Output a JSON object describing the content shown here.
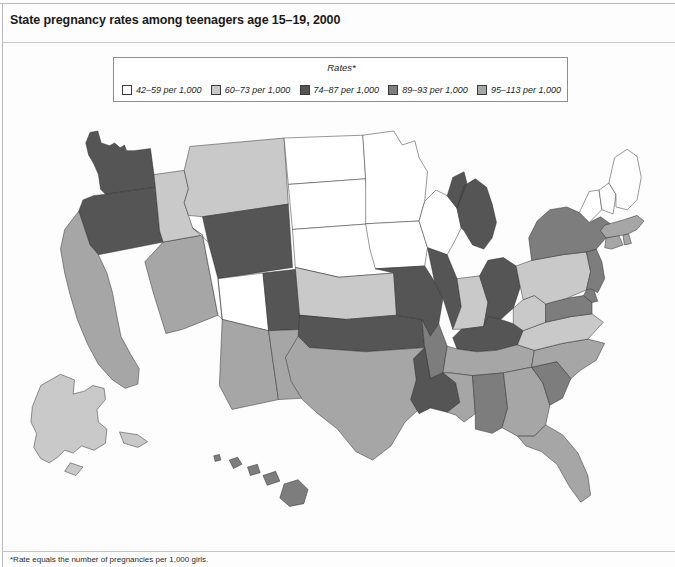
{
  "title": "State pregnancy rates among teenagers age 15–19, 2000",
  "legend": {
    "heading": "Rates*",
    "items": [
      {
        "label": "42–59 per 1,000",
        "color": "#ffffff",
        "key": "b1"
      },
      {
        "label": "60–73 per 1,000",
        "color": "#c9c9c9",
        "key": "b2"
      },
      {
        "label": "74–87 per 1,000",
        "color": "#555555",
        "key": "b3"
      },
      {
        "label": "89–93 per 1,000",
        "color": "#7d7d7d",
        "key": "b4"
      },
      {
        "label": "95–113 per 1,000",
        "color": "#a6a6a6",
        "key": "b5"
      }
    ]
  },
  "footnote": "*Rate equals the number of pregnancies per 1,000 girls.",
  "chart_data": {
    "type": "map",
    "title": "State pregnancy rates among teenagers age 15–19, 2000",
    "unit": "pregnancies per 1,000 girls age 15–19",
    "bins": [
      {
        "key": "b1",
        "range": "42–59",
        "min": 42,
        "max": 59,
        "color": "#ffffff"
      },
      {
        "key": "b2",
        "range": "60–73",
        "min": 60,
        "max": 73,
        "color": "#c9c9c9"
      },
      {
        "key": "b3",
        "range": "74–87",
        "min": 74,
        "max": 87,
        "color": "#555555"
      },
      {
        "key": "b4",
        "range": "89–93",
        "min": 89,
        "max": 93,
        "color": "#7d7d7d"
      },
      {
        "key": "b5",
        "range": "95–113",
        "min": 95,
        "max": 113,
        "color": "#a6a6a6"
      }
    ],
    "legend_position": "top-center",
    "regions": [
      {
        "id": "WA",
        "name": "Washington",
        "bin": "b3"
      },
      {
        "id": "OR",
        "name": "Oregon",
        "bin": "b3"
      },
      {
        "id": "CA",
        "name": "California",
        "bin": "b5"
      },
      {
        "id": "NV",
        "name": "Nevada",
        "bin": "b5"
      },
      {
        "id": "ID",
        "name": "Idaho",
        "bin": "b2"
      },
      {
        "id": "MT",
        "name": "Montana",
        "bin": "b2"
      },
      {
        "id": "WY",
        "name": "Wyoming",
        "bin": "b3"
      },
      {
        "id": "UT",
        "name": "Utah",
        "bin": "b1"
      },
      {
        "id": "AZ",
        "name": "Arizona",
        "bin": "b5"
      },
      {
        "id": "CO",
        "name": "Colorado",
        "bin": "b3"
      },
      {
        "id": "NM",
        "name": "New Mexico",
        "bin": "b5"
      },
      {
        "id": "ND",
        "name": "North Dakota",
        "bin": "b1"
      },
      {
        "id": "SD",
        "name": "South Dakota",
        "bin": "b1"
      },
      {
        "id": "NE",
        "name": "Nebraska",
        "bin": "b1"
      },
      {
        "id": "KS",
        "name": "Kansas",
        "bin": "b2"
      },
      {
        "id": "OK",
        "name": "Oklahoma",
        "bin": "b3"
      },
      {
        "id": "TX",
        "name": "Texas",
        "bin": "b5"
      },
      {
        "id": "MN",
        "name": "Minnesota",
        "bin": "b1"
      },
      {
        "id": "IA",
        "name": "Iowa",
        "bin": "b1"
      },
      {
        "id": "MO",
        "name": "Missouri",
        "bin": "b3"
      },
      {
        "id": "AR",
        "name": "Arkansas",
        "bin": "b4"
      },
      {
        "id": "LA",
        "name": "Louisiana",
        "bin": "b3"
      },
      {
        "id": "WI",
        "name": "Wisconsin",
        "bin": "b1"
      },
      {
        "id": "IL",
        "name": "Illinois",
        "bin": "b3"
      },
      {
        "id": "MI",
        "name": "Michigan",
        "bin": "b3"
      },
      {
        "id": "IN",
        "name": "Indiana",
        "bin": "b2"
      },
      {
        "id": "OH",
        "name": "Ohio",
        "bin": "b3"
      },
      {
        "id": "KY",
        "name": "Kentucky",
        "bin": "b3"
      },
      {
        "id": "TN",
        "name": "Tennessee",
        "bin": "b5"
      },
      {
        "id": "MS",
        "name": "Mississippi",
        "bin": "b5"
      },
      {
        "id": "AL",
        "name": "Alabama",
        "bin": "b4"
      },
      {
        "id": "GA",
        "name": "Georgia",
        "bin": "b5"
      },
      {
        "id": "FL",
        "name": "Florida",
        "bin": "b5"
      },
      {
        "id": "SC",
        "name": "South Carolina",
        "bin": "b4"
      },
      {
        "id": "NC",
        "name": "North Carolina",
        "bin": "b5"
      },
      {
        "id": "VA",
        "name": "Virginia",
        "bin": "b2"
      },
      {
        "id": "WV",
        "name": "West Virginia",
        "bin": "b2"
      },
      {
        "id": "MD",
        "name": "Maryland",
        "bin": "b4"
      },
      {
        "id": "DE",
        "name": "Delaware",
        "bin": "b4"
      },
      {
        "id": "PA",
        "name": "Pennsylvania",
        "bin": "b2"
      },
      {
        "id": "NJ",
        "name": "New Jersey",
        "bin": "b4"
      },
      {
        "id": "NY",
        "name": "New York",
        "bin": "b4"
      },
      {
        "id": "CT",
        "name": "Connecticut",
        "bin": "b5"
      },
      {
        "id": "RI",
        "name": "Rhode Island",
        "bin": "b5"
      },
      {
        "id": "MA",
        "name": "Massachusetts",
        "bin": "b5"
      },
      {
        "id": "VT",
        "name": "Vermont",
        "bin": "b1"
      },
      {
        "id": "NH",
        "name": "New Hampshire",
        "bin": "b1"
      },
      {
        "id": "ME",
        "name": "Maine",
        "bin": "b1"
      },
      {
        "id": "AK",
        "name": "Alaska",
        "bin": "b2"
      },
      {
        "id": "HI",
        "name": "Hawaii",
        "bin": "b4"
      }
    ]
  }
}
